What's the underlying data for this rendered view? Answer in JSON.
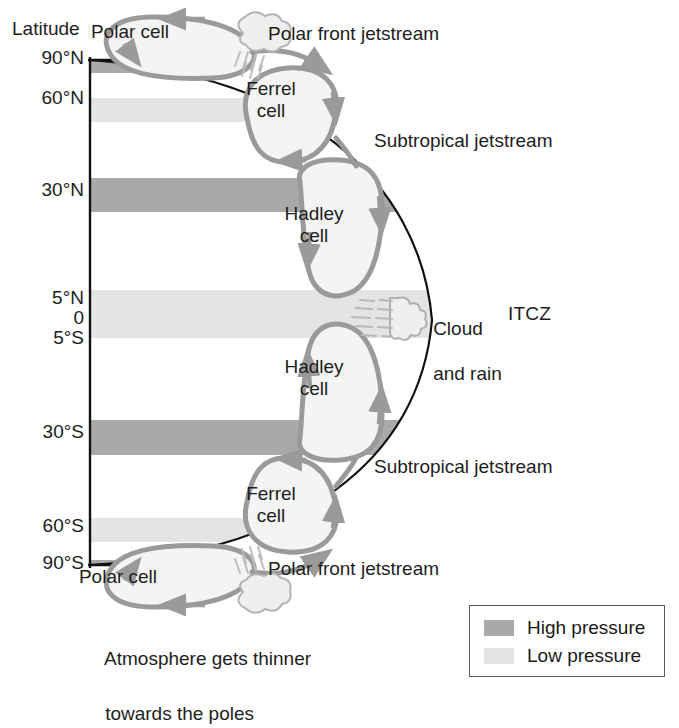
{
  "figure": {
    "axis_title": "Latitude",
    "note_line1": "Atmosphere gets thinner",
    "note_line2": "towards the poles",
    "itcz_label": "ITCZ",
    "cloud_line1": "Cloud",
    "cloud_line2": "and rain"
  },
  "colors": {
    "high_pressure": "#a9a9a9",
    "low_pressure": "#e4e4e4",
    "cell_outline": "#9a9a9a",
    "cell_fill": "#f4f4f4",
    "earth_line": "#111111",
    "axis_line": "#111111",
    "text": "#1d1d1d",
    "legend_border": "#5a5a5a",
    "background": "#ffffff"
  },
  "ticks": [
    {
      "label": "90°N",
      "y": 60
    },
    {
      "label": "60°N",
      "y": 100
    },
    {
      "label": "30°N",
      "y": 192
    },
    {
      "label": "5°N",
      "y": 300
    },
    {
      "label": "0",
      "y": 320
    },
    {
      "label": "5°S",
      "y": 340
    },
    {
      "label": "30°S",
      "y": 434
    },
    {
      "label": "60°S",
      "y": 528
    },
    {
      "label": "90°S",
      "y": 565
    }
  ],
  "pressure_bands": [
    {
      "name": "polar-high-north",
      "type": "high",
      "y": 61,
      "height": 12,
      "width": 195
    },
    {
      "name": "subpolar-low-north",
      "type": "low",
      "y": 98,
      "height": 24,
      "width": 285
    },
    {
      "name": "subtropical-high-north",
      "type": "high",
      "y": 178,
      "height": 34,
      "width": 330
    },
    {
      "name": "equatorial-low",
      "type": "low",
      "y": 290,
      "height": 48,
      "width": 348
    },
    {
      "name": "subtropical-high-south",
      "type": "high",
      "y": 420,
      "height": 35,
      "width": 330
    },
    {
      "name": "subpolar-low-south",
      "type": "low",
      "y": 518,
      "height": 24,
      "width": 280
    },
    {
      "name": "polar-high-south",
      "type": "high",
      "y": 560,
      "height": 12,
      "width": 195
    }
  ],
  "cells": [
    {
      "name": "polar-cell-north",
      "line1": "Polar cell",
      "line2": "",
      "x": 130,
      "y": 33
    },
    {
      "name": "ferrel-cell-north",
      "line1": "Ferrel",
      "line2": "cell",
      "x": 271,
      "y": 90
    },
    {
      "name": "hadley-cell-north",
      "line1": "Hadley",
      "line2": "cell",
      "x": 314,
      "y": 215
    },
    {
      "name": "hadley-cell-south",
      "line1": "Hadley",
      "line2": "cell",
      "x": 314,
      "y": 368
    },
    {
      "name": "ferrel-cell-south",
      "line1": "Ferrel",
      "line2": "cell",
      "x": 271,
      "y": 495
    },
    {
      "name": "polar-cell-south",
      "line1": "Polar cell",
      "line2": "",
      "x": 118,
      "y": 578
    }
  ],
  "jetstreams": [
    {
      "name": "polar-front-jetstream-north",
      "label": "Polar front jetstream",
      "x": 268,
      "y": 35
    },
    {
      "name": "subtropical-jetstream-north",
      "label": "Subtropical jetstream",
      "x": 374,
      "y": 142
    },
    {
      "name": "subtropical-jetstream-south",
      "label": "Subtropical jetstream",
      "x": 374,
      "y": 468
    },
    {
      "name": "polar-front-jetstream-south",
      "label": "Polar front jetstream",
      "x": 268,
      "y": 570
    }
  ],
  "legend": {
    "items": [
      {
        "name": "legend-high-pressure",
        "label": "High pressure",
        "swatch": "high"
      },
      {
        "name": "legend-low-pressure",
        "label": "Low pressure",
        "swatch": "low"
      }
    ]
  }
}
